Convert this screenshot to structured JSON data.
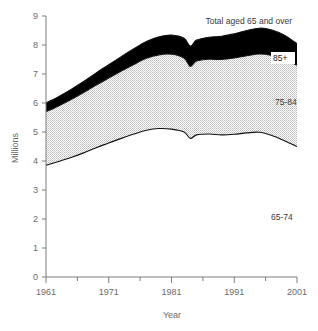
{
  "chart_data": {
    "type": "area",
    "title": "",
    "xlabel": "Year",
    "ylabel": "Millions",
    "xlim": [
      1961,
      2001
    ],
    "ylim": [
      0,
      9
    ],
    "grid": false,
    "stacked": true,
    "legend_position": "inline-annotations",
    "xticks": [
      1961,
      1971,
      1981,
      1991,
      2001
    ],
    "xminorticks": [
      1966,
      1976,
      1986,
      1996
    ],
    "yticks": [
      0,
      1,
      2,
      3,
      4,
      5,
      6,
      7,
      8,
      9
    ],
    "annotations": [
      {
        "id": "total",
        "text": "Total aged 65 and over"
      },
      {
        "id": "band-85plus",
        "text": "85+"
      },
      {
        "id": "band-75-84",
        "text": "75-84"
      },
      {
        "id": "band-65-74",
        "text": "65-74"
      }
    ],
    "x": [
      1961,
      1963,
      1965,
      1967,
      1969,
      1971,
      1973,
      1975,
      1977,
      1979,
      1981,
      1983,
      1984,
      1985,
      1987,
      1989,
      1991,
      1993,
      1995,
      1997,
      1999,
      2001
    ],
    "series": [
      {
        "name": "65-74",
        "values": [
          3.85,
          3.98,
          4.12,
          4.28,
          4.46,
          4.62,
          4.78,
          4.93,
          5.06,
          5.12,
          5.1,
          5.0,
          4.78,
          4.9,
          4.93,
          4.9,
          4.92,
          4.97,
          4.99,
          4.88,
          4.7,
          4.5
        ]
      },
      {
        "name": "75-84",
        "values": [
          1.85,
          1.92,
          2.0,
          2.08,
          2.16,
          2.24,
          2.32,
          2.4,
          2.48,
          2.54,
          2.58,
          2.55,
          2.48,
          2.55,
          2.58,
          2.6,
          2.63,
          2.66,
          2.7,
          2.76,
          2.82,
          2.8
        ]
      },
      {
        "name": "85+",
        "values": [
          0.3,
          0.32,
          0.35,
          0.38,
          0.42,
          0.46,
          0.5,
          0.54,
          0.58,
          0.62,
          0.66,
          0.68,
          0.7,
          0.72,
          0.76,
          0.8,
          0.84,
          0.87,
          0.89,
          0.88,
          0.82,
          0.75
        ]
      }
    ],
    "cumulative": {
      "65-74_top": [
        3.85,
        3.98,
        4.12,
        4.28,
        4.46,
        4.62,
        4.78,
        4.93,
        5.06,
        5.12,
        5.1,
        5.0,
        4.78,
        4.9,
        4.93,
        4.9,
        4.92,
        4.97,
        4.99,
        4.88,
        4.7,
        4.5
      ],
      "75-84_top": [
        5.7,
        5.9,
        6.12,
        6.36,
        6.62,
        6.86,
        7.1,
        7.33,
        7.54,
        7.66,
        7.68,
        7.55,
        7.26,
        7.45,
        7.51,
        7.5,
        7.55,
        7.63,
        7.69,
        7.64,
        7.52,
        7.3
      ],
      "total_top": [
        6.0,
        6.22,
        6.47,
        6.74,
        7.04,
        7.32,
        7.6,
        7.87,
        8.12,
        8.28,
        8.34,
        8.23,
        7.96,
        8.17,
        8.27,
        8.3,
        8.39,
        8.5,
        8.58,
        8.52,
        8.34,
        8.05
      ]
    }
  },
  "axes": {
    "y_tick_labels": [
      "9",
      "8",
      "7",
      "6",
      "5",
      "4",
      "3",
      "2",
      "1",
      "0"
    ],
    "x_tick_labels": [
      "1961",
      "1971",
      "1981",
      "1991",
      "2001"
    ],
    "y_axis_title": "Millions",
    "x_axis_title": "Year"
  },
  "labels": {
    "total": "Total aged 65 and over",
    "band85": "85+",
    "band7584": "75-84",
    "band6574": "65-74"
  },
  "colors": {
    "band_85plus": "#000000",
    "band_75_84": "#d6d6d6",
    "band_65_74": "#ffffff",
    "axis": "#7d7d7d",
    "text": "#5a5a5a",
    "line": "#111111"
  }
}
